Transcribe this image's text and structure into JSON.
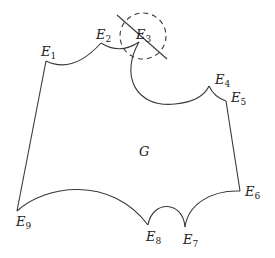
{
  "diagram": {
    "region_label": "G",
    "vertices": [
      {
        "letter": "E",
        "index": "1"
      },
      {
        "letter": "E",
        "index": "2"
      },
      {
        "letter": "E",
        "index": "3"
      },
      {
        "letter": "E",
        "index": "4"
      },
      {
        "letter": "E",
        "index": "5"
      },
      {
        "letter": "E",
        "index": "6"
      },
      {
        "letter": "E",
        "index": "7"
      },
      {
        "letter": "E",
        "index": "8"
      },
      {
        "letter": "E",
        "index": "9"
      }
    ],
    "colors": {
      "stroke": "#3a3a3a",
      "text": "#222222"
    }
  }
}
